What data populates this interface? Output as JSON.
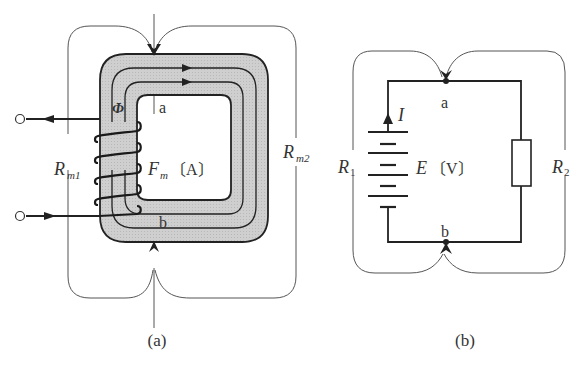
{
  "diagram": {
    "type": "magnetic-circuit-vs-electric-circuit-analogy",
    "panels": [
      {
        "id": "a",
        "caption": "(a)",
        "title": "Magnetic circuit",
        "labels": {
          "flux": "Φ",
          "mmf_symbol": "F",
          "mmf_sub": "m",
          "mmf_unit": "〔A〕",
          "node_top": "a",
          "node_bottom": "b",
          "reluctance_left_main": "R",
          "reluctance_left_sub": "m1",
          "reluctance_right_main": "R",
          "reluctance_right_sub": "m2"
        }
      },
      {
        "id": "b",
        "caption": "(b)",
        "title": "Electric circuit",
        "labels": {
          "current": "I",
          "emf_symbol": "E",
          "emf_unit": "〔V〕",
          "node_top": "a",
          "node_bottom": "b",
          "resistor_left_main": "R",
          "resistor_left_sub": "1",
          "resistor_right_main": "R",
          "resistor_right_sub": "2"
        }
      }
    ],
    "colors": {
      "core_fill": "#c8c8c8",
      "line": "#222222",
      "thin_line": "#555555",
      "background": "#ffffff"
    }
  }
}
